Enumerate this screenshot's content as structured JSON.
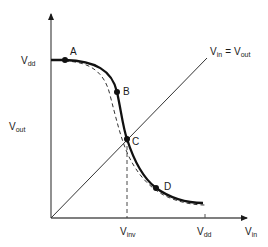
{
  "diagram": {
    "axes": {
      "x": {
        "main": "V",
        "sub": "in"
      },
      "y": {
        "main": "V",
        "sub": "out"
      }
    },
    "ticks": {
      "y_vdd": {
        "main": "V",
        "sub": "dd"
      },
      "x_vdd": {
        "main": "V",
        "sub": "dd"
      },
      "x_vinv": {
        "main": "V",
        "sub": "inv"
      }
    },
    "diagonal_label": {
      "left_main": "V",
      "left_sub": "in",
      "equals": "=",
      "right_main": "V",
      "right_sub": "out"
    },
    "points": [
      {
        "id": "A",
        "label": "A"
      },
      {
        "id": "B",
        "label": "B"
      },
      {
        "id": "C",
        "label": "C"
      },
      {
        "id": "D",
        "label": "D"
      }
    ],
    "curves": [
      {
        "name": "solid-transfer-curve",
        "style": "solid"
      },
      {
        "name": "dashed-transfer-curve",
        "style": "dashed"
      }
    ],
    "colors": {
      "ink": "#1a1a1a",
      "background": "#ffffff"
    }
  }
}
